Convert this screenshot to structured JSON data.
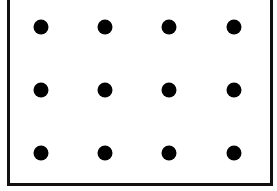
{
  "diagram": {
    "type": "dot-grid",
    "rows": 3,
    "columns": 4,
    "dot_color": "#000000",
    "border_color": "#111111",
    "background": "#ffffff",
    "column_x": [
      41,
      105,
      169,
      234
    ],
    "row_y": [
      27,
      90,
      153
    ]
  }
}
